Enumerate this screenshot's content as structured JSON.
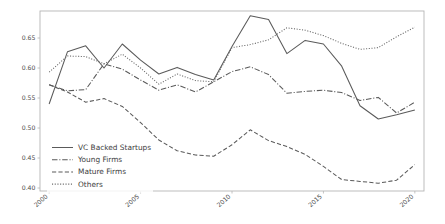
{
  "chart_data": {
    "type": "line",
    "title": "",
    "xlabel": "",
    "ylabel": "",
    "xlim": [
      1999.5,
      2020.5
    ],
    "ylim": [
      0.395,
      0.695
    ],
    "grid": false,
    "legend_position": "lower left",
    "x": [
      2000,
      2001,
      2002,
      2003,
      2004,
      2005,
      2006,
      2007,
      2008,
      2009,
      2010,
      2011,
      2012,
      2013,
      2014,
      2015,
      2016,
      2017,
      2018,
      2019,
      2020
    ],
    "xticks": [
      2000,
      2005,
      2010,
      2015,
      2020
    ],
    "xticklabels": [
      "2000",
      "2005",
      "2010",
      "2015",
      "2020"
    ],
    "yticks": [
      0.4,
      0.45,
      0.5,
      0.55,
      0.6,
      0.65
    ],
    "yticklabels": [
      "0.40",
      "0.45",
      "0.50",
      "0.55",
      "0.60",
      "0.65"
    ],
    "series": [
      {
        "name": "VC Backed Startups",
        "style": "solid",
        "color": "#5a5a5a",
        "values": [
          0.54,
          0.627,
          0.637,
          0.6,
          0.64,
          0.613,
          0.59,
          0.601,
          0.589,
          0.58,
          0.636,
          0.687,
          0.681,
          0.624,
          0.646,
          0.64,
          0.603,
          0.537,
          0.515,
          0.522,
          0.53
        ]
      },
      {
        "name": "Young Firms",
        "style": "dashdot",
        "color": "#5a5a5a",
        "values": [
          0.572,
          0.562,
          0.564,
          0.607,
          0.598,
          0.58,
          0.563,
          0.572,
          0.56,
          0.577,
          0.594,
          0.602,
          0.589,
          0.558,
          0.561,
          0.563,
          0.559,
          0.546,
          0.551,
          0.525,
          0.543
        ]
      },
      {
        "name": "Mature Firms",
        "style": "dashed",
        "color": "#5a5a5a",
        "values": [
          0.572,
          0.56,
          0.543,
          0.549,
          0.536,
          0.509,
          0.48,
          0.462,
          0.455,
          0.453,
          0.472,
          0.497,
          0.479,
          0.469,
          0.456,
          0.436,
          0.414,
          0.411,
          0.408,
          0.413,
          0.439
        ]
      },
      {
        "name": "Others",
        "style": "dotted",
        "color": "#6a6a6a",
        "values": [
          0.593,
          0.62,
          0.619,
          0.607,
          0.623,
          0.6,
          0.573,
          0.59,
          0.579,
          0.577,
          0.634,
          0.639,
          0.647,
          0.667,
          0.663,
          0.654,
          0.641,
          0.631,
          0.634,
          0.652,
          0.668
        ]
      }
    ]
  },
  "legend": {
    "items": [
      {
        "label": "VC Backed Startups",
        "style": "solid"
      },
      {
        "label": "Young Firms",
        "style": "dashdot"
      },
      {
        "label": "Mature Firms",
        "style": "dashed"
      },
      {
        "label": "Others",
        "style": "dotted"
      }
    ]
  },
  "axes": {
    "spine_color": "#b5b5b5",
    "tick_color": "#4d4d4d"
  }
}
